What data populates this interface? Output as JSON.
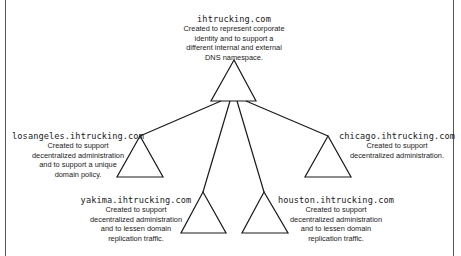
{
  "diagram": {
    "type": "domain-tree",
    "colors": {
      "line": "#1a1a1a",
      "text": "#1a1a1a",
      "border": "#555555",
      "background": "#ffffff"
    },
    "nodes": {
      "root": {
        "name": "ihtrucking.com",
        "description": [
          "Created to represent corporate",
          "identity and to support a",
          "different internal and external",
          "DNS namespace."
        ]
      },
      "losangeles": {
        "name": "losangeles.ihtrucking.com",
        "description": [
          "Created to support",
          "decentralized administration",
          "and to support a unique",
          "domain policy."
        ]
      },
      "chicago": {
        "name": "chicago.ihtrucking.com",
        "description": [
          "Created to support",
          "decentralized administration."
        ]
      },
      "yakima": {
        "name": "yakima.ihtrucking.com",
        "description": [
          "Created to support",
          "decentralized administration",
          "and to lessen domain",
          "replication traffic."
        ]
      },
      "houston": {
        "name": "houston.ihtrucking.com",
        "description": [
          "Created to support",
          "decentralized administration",
          "and to lessen domain",
          "replication traffic."
        ]
      }
    },
    "edges": [
      [
        "root",
        "losangeles"
      ],
      [
        "root",
        "yakima"
      ],
      [
        "root",
        "houston"
      ],
      [
        "root",
        "chicago"
      ]
    ]
  }
}
